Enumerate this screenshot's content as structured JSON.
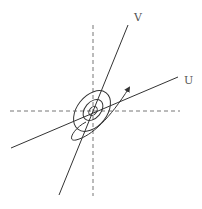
{
  "diagram": {
    "type": "rotated-axes-with-elliptical-contours",
    "labels": {
      "v_axis": "V",
      "u_axis": "U"
    },
    "colors": {
      "line": "#333333",
      "dashed": "#777777",
      "label": "#555555",
      "background": "#ffffff"
    },
    "original_axes": {
      "horizontal": {
        "x1": 10,
        "y1": 111,
        "x2": 180,
        "y2": 111,
        "style": "dashed"
      },
      "vertical": {
        "x1": 93,
        "y1": 25,
        "x2": 93,
        "y2": 196,
        "style": "dashed"
      }
    },
    "rotated_axes": {
      "v": {
        "x1": 59,
        "y1": 195,
        "x2": 128,
        "y2": 25
      },
      "u": {
        "x1": 11,
        "y1": 148,
        "x2": 178,
        "y2": 77
      }
    },
    "contours": [
      {
        "cx": 93,
        "cy": 111,
        "rx": 5,
        "ry": 3.5,
        "rotate": -50
      },
      {
        "cx": 93,
        "cy": 110,
        "rx": 12,
        "ry": 8,
        "rotate": -50
      },
      {
        "cx": 92,
        "cy": 111,
        "rx": 23,
        "ry": 15,
        "rotate": -52
      }
    ],
    "path_arrow": {
      "d": "M 81 128 C 64 138, 70 145, 90 128 C 110 112, 122 104, 129 88"
    }
  }
}
